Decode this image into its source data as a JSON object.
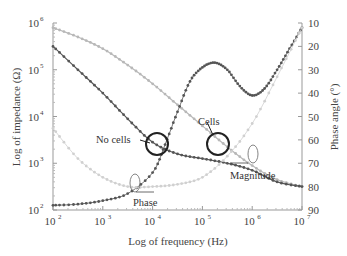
{
  "chart_data": {
    "type": "line",
    "title": "",
    "xlabel": "Log of frequency (Hz)",
    "ylabel": "Log of impedance (Ω)",
    "y2label": "Phase angle (°)",
    "xscale": "log",
    "yscale": "log",
    "xlim": [
      100,
      10000000
    ],
    "ylim": [
      100,
      1000000
    ],
    "y2lim": [
      90,
      10
    ],
    "grid": false,
    "x_ticks": [
      {
        "exp": "2",
        "label": "10",
        "pos": 2
      },
      {
        "exp": "3",
        "label": "10",
        "pos": 3
      },
      {
        "exp": "4",
        "label": "10",
        "pos": 4
      },
      {
        "exp": "5",
        "label": "10",
        "pos": 5
      },
      {
        "exp": "6",
        "label": "10",
        "pos": 6
      },
      {
        "exp": "7",
        "label": "10",
        "pos": 7
      }
    ],
    "y_ticks": [
      {
        "exp": "6",
        "label": "10",
        "pos": 6
      },
      {
        "exp": "5",
        "label": "10",
        "pos": 5
      },
      {
        "exp": "4",
        "label": "10",
        "pos": 4
      },
      {
        "exp": "3",
        "label": "10",
        "pos": 3
      },
      {
        "exp": "2",
        "label": "10",
        "pos": 2
      }
    ],
    "y2_ticks": [
      "10",
      "20",
      "30",
      "40",
      "50",
      "60",
      "70",
      "80",
      "90"
    ],
    "series": [
      {
        "name": "Magnitude (no cells)",
        "axis": "left",
        "color": "#b8b8b8",
        "log_x": [
          2,
          2.5,
          3,
          3.5,
          4,
          4.5,
          5,
          5.5,
          6,
          6.5,
          7
        ],
        "log_y": [
          5.9,
          5.7,
          5.45,
          5.1,
          4.7,
          4.25,
          3.8,
          3.35,
          2.95,
          2.65,
          2.5
        ]
      },
      {
        "name": "Magnitude (cells)",
        "axis": "left",
        "color": "#555555",
        "log_x": [
          2,
          2.5,
          3,
          3.5,
          4,
          4.5,
          5,
          5.5,
          6,
          6.5,
          7
        ],
        "log_y": [
          5.5,
          5.0,
          4.5,
          3.95,
          3.45,
          3.2,
          3.1,
          3.0,
          2.85,
          2.6,
          2.5
        ]
      },
      {
        "name": "Phase (cells)",
        "axis": "right",
        "color": "#555555",
        "log_x": [
          2,
          2.5,
          3,
          3.5,
          4,
          4.25,
          4.5,
          4.75,
          5,
          5.25,
          5.5,
          5.75,
          6,
          6.25,
          6.5,
          6.75,
          7
        ],
        "phase": [
          88,
          87.5,
          86,
          83,
          74,
          62,
          48,
          35,
          29,
          27,
          30,
          37,
          41,
          38,
          30,
          21,
          12
        ]
      },
      {
        "name": "Phase (no cells)",
        "axis": "right",
        "color": "#d0d0d0",
        "log_x": [
          2,
          2.5,
          3,
          3.5,
          4,
          4.5,
          5,
          5.5,
          6,
          6.5,
          7
        ],
        "phase": [
          55,
          68,
          76,
          80,
          80,
          79,
          76,
          67,
          53,
          33,
          12
        ]
      }
    ],
    "annotations": [
      {
        "text": "No cells"
      },
      {
        "text": "Cells"
      },
      {
        "text": "Phase"
      },
      {
        "text": "Magnitude"
      }
    ]
  }
}
